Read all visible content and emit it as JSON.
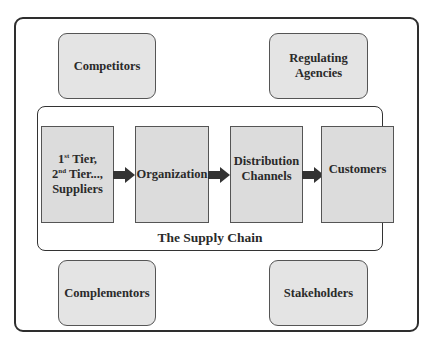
{
  "diagram": {
    "external_entities": {
      "top_left": "Competitors",
      "top_right": "Regulating Agencies",
      "bottom_left": "Complementors",
      "bottom_right": "Stakeholders"
    },
    "supply_chain": {
      "label": "The Supply Chain",
      "stages": [
        {
          "line1_num": "1",
          "line1_sup": "st",
          "line1_rest": " Tier,",
          "line2_num": "2",
          "line2_sup": "nd",
          "line2_rest": " Tier...,",
          "line3": "Suppliers"
        },
        {
          "label": "Organization"
        },
        {
          "label": "Distribution Channels"
        },
        {
          "label": "Customers"
        }
      ],
      "arrows": [
        "right-arrow",
        "right-arrow",
        "right-arrow"
      ]
    },
    "colors": {
      "box_fill": "#dcdcdc",
      "border": "#2e2e2e",
      "arrow": "#333333"
    }
  }
}
